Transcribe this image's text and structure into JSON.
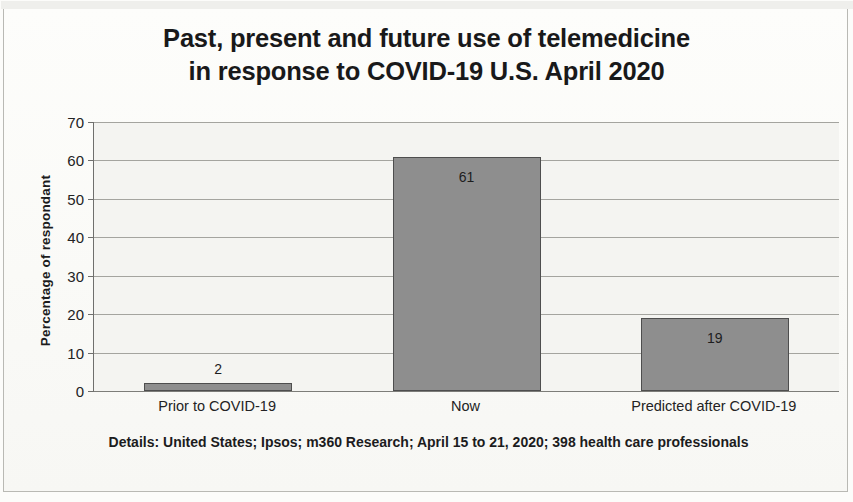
{
  "chart_data": {
    "type": "bar",
    "title": "Past, present and future use of telemedicine in response to COVID-19 U.S. April 2020",
    "title_lines": [
      "Past, present and future use of telemedicine",
      "in response to COVID-19 U.S. April 2020"
    ],
    "categories": [
      "Prior to COVID-19",
      "Now",
      "Predicted after COVID-19"
    ],
    "values": [
      2,
      61,
      19
    ],
    "value_labels": [
      "2",
      "61",
      "19"
    ],
    "xlabel": "",
    "ylabel": "Percentage of respondant",
    "ylim": [
      0,
      70
    ],
    "yticks": [
      0,
      10,
      20,
      30,
      40,
      50,
      60,
      70
    ],
    "ytick_labels": [
      "0",
      "10",
      "20",
      "30",
      "40",
      "50",
      "60",
      "70"
    ],
    "grid": true,
    "grid_axis": "y",
    "legend": false,
    "bar_color": "#8e8e8e",
    "bar_border_color": "#4e4e4e",
    "plot_background": "#f4f4f1",
    "gridline_color": "#a4a49f",
    "text_color": "#1c1c1d"
  },
  "footnote": {
    "line1": "Details:  United States; Ipsos;  m360 Research;  April 15 to 21, 2020; 398 health care",
    "line2": "professionals"
  }
}
